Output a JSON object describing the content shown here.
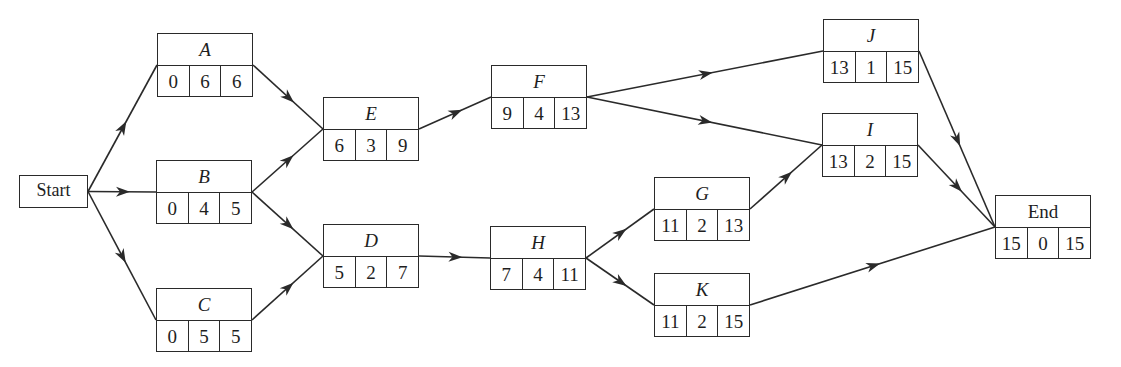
{
  "diagram": {
    "type": "activity-on-node network",
    "line_color": "#2a2a2a",
    "start": {
      "id": "start",
      "label": "Start",
      "x": 19,
      "y": 175,
      "w": 69,
      "h": 33
    },
    "nodes": [
      {
        "id": "A",
        "label": "A",
        "italic": true,
        "x": 157,
        "y": 33,
        "values": [
          "0",
          "6",
          "6"
        ]
      },
      {
        "id": "B",
        "label": "B",
        "italic": true,
        "x": 156,
        "y": 160,
        "values": [
          "0",
          "4",
          "5"
        ]
      },
      {
        "id": "C",
        "label": "C",
        "italic": true,
        "x": 156,
        "y": 288,
        "values": [
          "0",
          "5",
          "5"
        ]
      },
      {
        "id": "E",
        "label": "E",
        "italic": true,
        "x": 323,
        "y": 97,
        "values": [
          "6",
          "3",
          "9"
        ]
      },
      {
        "id": "D",
        "label": "D",
        "italic": true,
        "x": 323,
        "y": 224,
        "values": [
          "5",
          "2",
          "7"
        ]
      },
      {
        "id": "F",
        "label": "F",
        "italic": true,
        "x": 491,
        "y": 65,
        "values": [
          "9",
          "4",
          "13"
        ]
      },
      {
        "id": "H",
        "label": "H",
        "italic": true,
        "x": 490,
        "y": 226,
        "values": [
          "7",
          "4",
          "11"
        ]
      },
      {
        "id": "G",
        "label": "G",
        "italic": true,
        "x": 654,
        "y": 177,
        "values": [
          "11",
          "2",
          "13"
        ]
      },
      {
        "id": "K",
        "label": "K",
        "italic": true,
        "x": 654,
        "y": 273,
        "values": [
          "11",
          "2",
          "15"
        ]
      },
      {
        "id": "J",
        "label": "J",
        "italic": true,
        "x": 823,
        "y": 19,
        "values": [
          "13",
          "1",
          "15"
        ]
      },
      {
        "id": "I",
        "label": "I",
        "italic": true,
        "x": 822,
        "y": 113,
        "values": [
          "13",
          "2",
          "15"
        ]
      },
      {
        "id": "End",
        "label": "End",
        "italic": false,
        "x": 995,
        "y": 195,
        "values": [
          "15",
          "0",
          "15"
        ]
      }
    ],
    "edges": [
      [
        "start",
        "A"
      ],
      [
        "start",
        "B"
      ],
      [
        "start",
        "C"
      ],
      [
        "A",
        "E"
      ],
      [
        "B",
        "E"
      ],
      [
        "B",
        "D"
      ],
      [
        "C",
        "D"
      ],
      [
        "E",
        "F"
      ],
      [
        "D",
        "H"
      ],
      [
        "F",
        "J"
      ],
      [
        "F",
        "I"
      ],
      [
        "H",
        "G"
      ],
      [
        "H",
        "K"
      ],
      [
        "G",
        "I"
      ],
      [
        "J",
        "End"
      ],
      [
        "I",
        "End"
      ],
      [
        "K",
        "End"
      ]
    ]
  }
}
